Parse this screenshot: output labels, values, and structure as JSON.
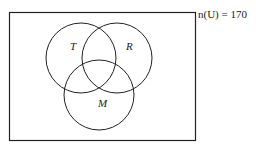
{
  "diagram": {
    "type": "venn",
    "universe_label": "n(U) = 170",
    "sets": [
      {
        "name": "T",
        "label": "T"
      },
      {
        "name": "R",
        "label": "R"
      },
      {
        "name": "M",
        "label": "M"
      }
    ],
    "colors": {
      "stroke": "#222222",
      "background": "#ffffff"
    }
  }
}
